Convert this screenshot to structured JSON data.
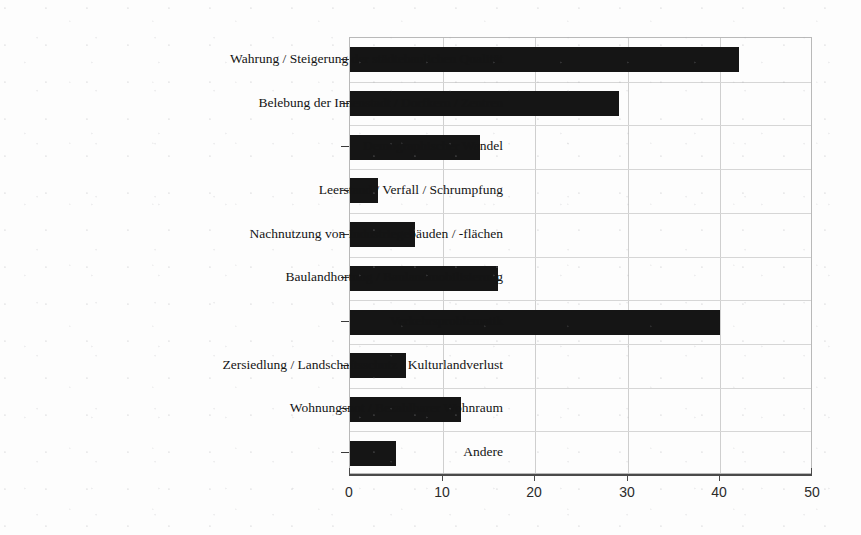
{
  "chart_data": {
    "type": "bar",
    "orientation": "horizontal",
    "title": "",
    "subtitle": "",
    "xlabel": "",
    "ylabel": "",
    "xlim": [
      0,
      50
    ],
    "ylim": null,
    "grid": true,
    "legend": null,
    "bar_color": "#151515",
    "categories": [
      "Wahrung / Steigerung der städtebaulichen Qualität",
      "Belebung der Innenstadt / Dorfkern / Zentren",
      "Demographischer Wandel",
      "Leerstand / Verfall / Schrumpfung",
      "Nachnutzung von Industriegebäuden / -flächen",
      "Baulandhortung / Baulandmobilisierung",
      "Verkehrsproblematik",
      "Zersiedlung / Landschaftsschutz / Kulturlandverlust",
      "Wohnungsnot / Bezahlbarer Wohnraum",
      "Andere"
    ],
    "values": [
      42,
      29,
      14,
      3,
      7,
      16,
      40,
      6,
      12,
      5
    ],
    "xticks": [
      0,
      10,
      20,
      30,
      40,
      50
    ],
    "xtick_labels": [
      "0",
      "10",
      "20",
      "30",
      "40",
      "50"
    ]
  }
}
